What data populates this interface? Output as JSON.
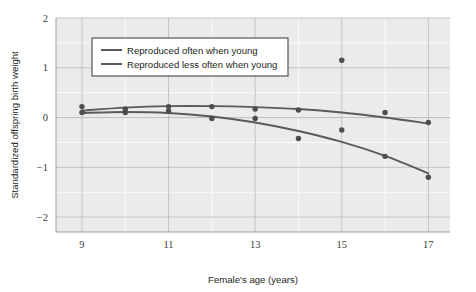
{
  "chart_data": {
    "type": "scatter",
    "title": "",
    "xlabel": "Female's age (years)",
    "ylabel": "Standardized offspring birth weight",
    "xlim": [
      8.4,
      17.5
    ],
    "ylim": [
      -2.3,
      2.0
    ],
    "xticks": [
      9,
      11,
      13,
      15,
      17
    ],
    "yticks": [
      2,
      1,
      0,
      -1,
      -2
    ],
    "xtick_labels": [
      "9",
      "11",
      "13",
      "15",
      "17"
    ],
    "ytick_labels": [
      "2",
      "1",
      "0",
      "−1",
      "−2"
    ],
    "grid": true,
    "legend_position": "top-left",
    "plot_bg": "#ebebeb",
    "grid_color": "#ffffff",
    "axis_line_color": "#b9b9b9",
    "marker_color": "#4d4d4d",
    "line_color": "#5a5a5a",
    "series": [
      {
        "name": "Reproduced often when young",
        "color": "#5a5a5a",
        "x": [
          9,
          10,
          11,
          12,
          13,
          14,
          15,
          16,
          17
        ],
        "values": [
          0.22,
          0.17,
          0.22,
          0.22,
          0.17,
          0.15,
          1.15,
          0.1,
          -0.1
        ],
        "fit_x": [
          9,
          10,
          11,
          12,
          13,
          14,
          15,
          16,
          17
        ],
        "fit_y": [
          0.14,
          0.2,
          0.23,
          0.23,
          0.21,
          0.17,
          0.1,
          0.0,
          -0.12
        ]
      },
      {
        "name": "Reproduced less often when young",
        "color": "#5a5a5a",
        "x": [
          9,
          10,
          11,
          12,
          13,
          14,
          15,
          16,
          17
        ],
        "values": [
          0.1,
          0.1,
          0.13,
          -0.02,
          -0.02,
          -0.42,
          -0.25,
          -0.78,
          -1.2
        ],
        "fit_x": [
          9,
          10,
          11,
          12,
          13,
          14,
          15,
          16,
          17
        ],
        "fit_y": [
          0.09,
          0.11,
          0.09,
          0.02,
          -0.1,
          -0.27,
          -0.49,
          -0.77,
          -1.12
        ]
      }
    ]
  },
  "legend": {
    "entries": [
      {
        "label": "Reproduced often when young"
      },
      {
        "label": "Reproduced less often when young"
      }
    ]
  }
}
